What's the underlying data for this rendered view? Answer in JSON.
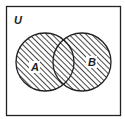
{
  "diagram": {
    "type": "venn",
    "universe_label": "U",
    "sets": [
      {
        "label": "A",
        "cx": 45,
        "cy": 62,
        "r": 29
      },
      {
        "label": "B",
        "cx": 82,
        "cy": 62,
        "r": 29
      }
    ],
    "shaded_region": "A ∪ B",
    "colors": {
      "stroke": "#222222",
      "hatch": "#333333",
      "background": "#ffffff"
    }
  }
}
